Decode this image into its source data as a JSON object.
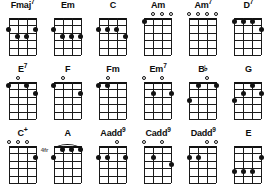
{
  "layout": {
    "rows": 3,
    "columns": 6,
    "strings": 4,
    "frets": 5
  },
  "colors": {
    "background": "#ffffff",
    "ink": "#111111",
    "fret_marker": "#555555"
  },
  "rows": [
    {
      "chords": [
        {
          "name": "Fmaj7",
          "root": "Fmaj",
          "superscript": "7",
          "open_strings": [],
          "dots": [
            {
              "string": 1,
              "fret": 2
            },
            {
              "string": 2,
              "fret": 3
            },
            {
              "string": 3,
              "fret": 3
            },
            {
              "string": 4,
              "fret": 2
            }
          ],
          "barre": null,
          "fret_marker": ""
        },
        {
          "name": "Em",
          "root": "Em",
          "superscript": "",
          "open_strings": [],
          "dots": [
            {
              "string": 1,
              "fret": 2
            },
            {
              "string": 2,
              "fret": 3
            },
            {
              "string": 3,
              "fret": 3
            },
            {
              "string": 4,
              "fret": 3
            }
          ],
          "barre": null,
          "fret_marker": ""
        },
        {
          "name": "C",
          "root": "C",
          "superscript": "",
          "open_strings": [],
          "dots": [
            {
              "string": 1,
              "fret": 2
            },
            {
              "string": 2,
              "fret": 2
            },
            {
              "string": 3,
              "fret": 2
            },
            {
              "string": 4,
              "fret": 3
            }
          ],
          "barre": null,
          "fret_marker": ""
        },
        {
          "name": "Am",
          "root": "Am",
          "superscript": "",
          "open_strings": [
            2,
            3,
            4
          ],
          "dots": [
            {
              "string": 1,
              "fret": 1
            }
          ],
          "barre": null,
          "fret_marker": ""
        },
        {
          "name": "Am7",
          "root": "Am",
          "superscript": "7",
          "open_strings": [
            1,
            2,
            3,
            4
          ],
          "dots": [],
          "barre": null,
          "fret_marker": ""
        },
        {
          "name": "D7",
          "root": "D",
          "superscript": "7",
          "open_strings": [],
          "dots": [
            {
              "string": 1,
              "fret": 1
            },
            {
              "string": 2,
              "fret": 1
            },
            {
              "string": 3,
              "fret": 1
            },
            {
              "string": 4,
              "fret": 2
            }
          ],
          "barre": null,
          "fret_marker": ""
        }
      ]
    },
    {
      "chords": [
        {
          "name": "E7",
          "root": "E",
          "superscript": "7",
          "open_strings": [
            2
          ],
          "dots": [
            {
              "string": 1,
              "fret": 1
            },
            {
              "string": 3,
              "fret": 1
            },
            {
              "string": 4,
              "fret": 2
            }
          ],
          "barre": null,
          "fret_marker": ""
        },
        {
          "name": "F",
          "root": "F",
          "superscript": "",
          "open_strings": [
            2
          ],
          "dots": [
            {
              "string": 1,
              "fret": 1
            },
            {
              "string": 4,
              "fret": 2
            }
          ],
          "barre": null,
          "fret_marker": ""
        },
        {
          "name": "Fm",
          "root": "Fm",
          "superscript": "",
          "open_strings": [
            2
          ],
          "dots": [
            {
              "string": 1,
              "fret": 1
            },
            {
              "string": 2,
              "fret": 1
            }
          ],
          "barre": null,
          "fret_marker": ""
        },
        {
          "name": "Em7",
          "root": "Em",
          "superscript": "7",
          "open_strings": [
            1,
            3
          ],
          "dots": [
            {
              "string": 2,
              "fret": 2
            },
            {
              "string": 4,
              "fret": 2
            }
          ],
          "barre": null,
          "fret_marker": ""
        },
        {
          "name": "Bb",
          "root": "B",
          "superscript": "",
          "flat": true,
          "open_strings": [
            3
          ],
          "dots": [
            {
              "string": 1,
              "fret": 3
            },
            {
              "string": 2,
              "fret": 1
            },
            {
              "string": 4,
              "fret": 1
            }
          ],
          "barre": null,
          "fret_marker": ""
        },
        {
          "name": "G",
          "root": "G",
          "superscript": "",
          "open_strings": [],
          "dots": [
            {
              "string": 1,
              "fret": 3
            },
            {
              "string": 2,
              "fret": 2
            },
            {
              "string": 3,
              "fret": 1
            },
            {
              "string": 4,
              "fret": 2
            }
          ],
          "barre": null,
          "fret_marker": ""
        }
      ]
    },
    {
      "chords": [
        {
          "name": "C+",
          "root": "C",
          "superscript": "+",
          "open_strings": [
            1,
            2,
            3
          ],
          "dots": [
            {
              "string": 4,
              "fret": 2
            }
          ],
          "barre": null,
          "fret_marker": ""
        },
        {
          "name": "A",
          "root": "A",
          "superscript": "",
          "open_strings": [],
          "dots": [
            {
              "string": 1,
              "fret": 2
            },
            {
              "string": 2,
              "fret": 1
            },
            {
              "string": 3,
              "fret": 1
            },
            {
              "string": 4,
              "fret": 1
            }
          ],
          "barre": {
            "fret": 1,
            "from_string": 1,
            "to_string": 4
          },
          "fret_marker": "4fr"
        },
        {
          "name": "Aadd9",
          "root": "Aadd",
          "superscript": "9",
          "open_strings": [
            3
          ],
          "dots": [
            {
              "string": 1,
              "fret": 2
            },
            {
              "string": 2,
              "fret": 2
            },
            {
              "string": 4,
              "fret": 2
            }
          ],
          "barre": null,
          "fret_marker": ""
        },
        {
          "name": "Cadd9",
          "root": "Cadd",
          "superscript": "9",
          "open_strings": [
            1,
            3
          ],
          "dots": [
            {
              "string": 2,
              "fret": 2
            },
            {
              "string": 4,
              "fret": 3
            }
          ],
          "barre": null,
          "fret_marker": ""
        },
        {
          "name": "Dadd9",
          "root": "Dadd",
          "superscript": "9",
          "open_strings": [
            3,
            4
          ],
          "dots": [
            {
              "string": 1,
              "fret": 2
            },
            {
              "string": 2,
              "fret": 2
            }
          ],
          "barre": null,
          "fret_marker": ""
        },
        {
          "name": "E",
          "root": "E",
          "superscript": "",
          "open_strings": [],
          "dots": [
            {
              "string": 1,
              "fret": 4
            },
            {
              "string": 2,
              "fret": 4
            },
            {
              "string": 3,
              "fret": 4
            },
            {
              "string": 4,
              "fret": 2
            }
          ],
          "barre": null,
          "fret_marker": ""
        }
      ]
    }
  ]
}
